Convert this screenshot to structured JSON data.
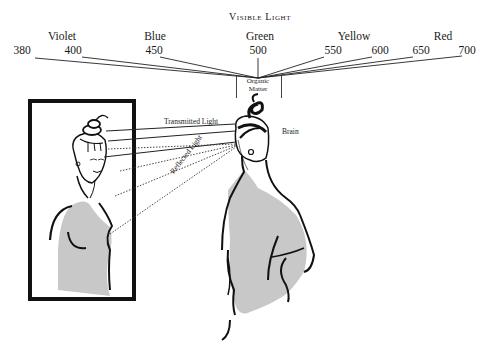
{
  "diagram": {
    "title": "Visible Light",
    "spectrum": {
      "colors": [
        {
          "name": "Violet",
          "x": 62
        },
        {
          "name": "Blue",
          "x": 155
        },
        {
          "name": "Green",
          "x": 260
        },
        {
          "name": "Yellow",
          "x": 354
        },
        {
          "name": "Red",
          "x": 443
        }
      ],
      "wavelengths": [
        {
          "value": "380",
          "x": 22
        },
        {
          "value": "400",
          "x": 73
        },
        {
          "value": "450",
          "x": 154
        },
        {
          "value": "500",
          "x": 258
        },
        {
          "value": "550",
          "x": 333
        },
        {
          "value": "600",
          "x": 380
        },
        {
          "value": "650",
          "x": 421
        },
        {
          "value": "700",
          "x": 467
        }
      ]
    },
    "organic_matter_label_line1": "Organic",
    "organic_matter_label_line2": "Matter",
    "transmitted_light_label": "Transmitted Light",
    "reflected_light_label": "Reflected Light",
    "brain_label": "Brain",
    "colors": {
      "ink": "#111111",
      "skin_shade": "#c8c8c8",
      "background": "#ffffff"
    }
  }
}
